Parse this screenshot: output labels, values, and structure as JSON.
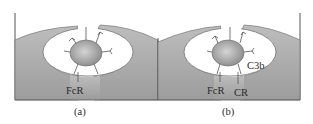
{
  "figure": {
    "panels": [
      {
        "id": "a",
        "caption": "(a)",
        "labels": {
          "receptor_1": "FcR"
        }
      },
      {
        "id": "b",
        "caption": "(b)",
        "labels": {
          "receptor_1": "FcR",
          "receptor_2": "CR",
          "ligand": "C3b"
        }
      }
    ],
    "colors": {
      "cell_fill": "#a9a9a9",
      "cell_fill_light": "#c8c8c8",
      "particle": "#9a9a9a",
      "line": "#555555",
      "background": "#ffffff"
    }
  }
}
